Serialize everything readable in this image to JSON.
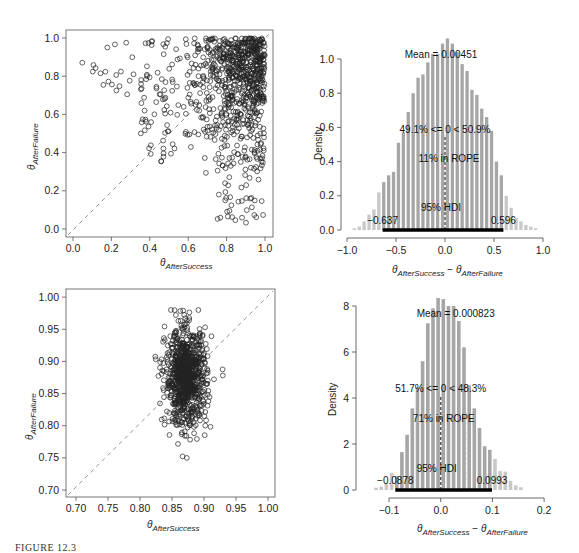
{
  "caption": "FIGURE 12.3",
  "chart_data": [
    {
      "type": "scatter",
      "panel": "top-left",
      "xlabel": "θ AfterSuccess",
      "ylabel": "θ AfterFailure",
      "xlim": [
        -0.03,
        1.03
      ],
      "ylim": [
        -0.03,
        1.03
      ],
      "xticks": [
        "0.0",
        "0.2",
        "0.4",
        "0.6",
        "0.8",
        "1.0"
      ],
      "yticks": [
        "0.0",
        "0.2",
        "0.4",
        "0.6",
        "0.8",
        "1.0"
      ],
      "reference_line": "y = x (dashed)",
      "description": "~1000 posterior samples, concentrated at high AfterSuccess (0.6–1.0) and high AfterFailure (0.4–1.0), sparse tail toward low values"
    },
    {
      "type": "bar",
      "panel": "top-right",
      "xlabel": "θ AfterSuccess − θ AfterFailure",
      "ylabel": "Density",
      "xlim": [
        -1.0,
        1.0
      ],
      "ylim": [
        0,
        1.1
      ],
      "xticks": [
        "−1.0",
        "−0.5",
        "0.0",
        "0.5",
        "1.0"
      ],
      "yticks": [
        "0.0",
        "0.2",
        "0.4",
        "0.6",
        "0.8",
        "1.0"
      ],
      "bin_width": 0.05,
      "bin_centers": [
        -0.925,
        -0.875,
        -0.825,
        -0.775,
        -0.725,
        -0.675,
        -0.625,
        -0.575,
        -0.525,
        -0.475,
        -0.425,
        -0.375,
        -0.325,
        -0.275,
        -0.225,
        -0.175,
        -0.125,
        -0.075,
        -0.025,
        0.025,
        0.075,
        0.125,
        0.175,
        0.225,
        0.275,
        0.325,
        0.375,
        0.425,
        0.475,
        0.525,
        0.575,
        0.625,
        0.675,
        0.725,
        0.775,
        0.825,
        0.875,
        0.925
      ],
      "values": [
        0.01,
        0.02,
        0.05,
        0.09,
        0.12,
        0.22,
        0.28,
        0.32,
        0.34,
        0.51,
        0.57,
        0.69,
        0.8,
        0.89,
        0.91,
        0.98,
        1.03,
        1.03,
        1.09,
        1.12,
        1.09,
        1.04,
        0.97,
        0.93,
        0.82,
        0.79,
        0.71,
        0.66,
        0.58,
        0.4,
        0.32,
        0.2,
        0.13,
        0.07,
        0.05,
        0.03,
        0.02,
        0.01
      ],
      "annotations": {
        "mean": "Mean = 0.00451",
        "compare": "49.1% <= 0 < 50.9%",
        "rope": "11% in ROPE",
        "hdi": "95% HDI",
        "hdi_low": "−0.637",
        "hdi_high": "0.596"
      },
      "hdi": [
        -0.637,
        0.596
      ],
      "rope": [
        -0.05,
        0.05
      ]
    },
    {
      "type": "scatter",
      "panel": "bottom-left",
      "xlabel": "θ AfterSuccess",
      "ylabel": "θ AfterFailure",
      "xlim": [
        0.69,
        1.01
      ],
      "ylim": [
        0.69,
        1.01
      ],
      "xticks": [
        "0.70",
        "0.75",
        "0.80",
        "0.85",
        "0.90",
        "0.95",
        "1.00"
      ],
      "yticks": [
        "0.70",
        "0.75",
        "0.80",
        "0.85",
        "0.90",
        "0.95",
        "1.00"
      ],
      "reference_line": "y = x (dashed)",
      "description": "~1000 posterior samples clustered around (0.87, 0.88), x spread 0.82–0.93, y spread 0.72–0.98"
    },
    {
      "type": "bar",
      "panel": "bottom-right",
      "xlabel": "θ AfterSuccess − θ AfterFailure",
      "ylabel": "Density",
      "xlim": [
        -0.15,
        0.2
      ],
      "ylim": [
        0,
        8.5
      ],
      "xticks": [
        "−0.1",
        "0.0",
        "0.1",
        "0.2"
      ],
      "yticks": [
        "0",
        "2",
        "4",
        "6",
        "8"
      ],
      "bin_width": 0.01,
      "bin_centers": [
        -0.125,
        -0.115,
        -0.105,
        -0.095,
        -0.085,
        -0.075,
        -0.065,
        -0.055,
        -0.045,
        -0.035,
        -0.025,
        -0.015,
        -0.005,
        0.005,
        0.015,
        0.025,
        0.035,
        0.045,
        0.055,
        0.065,
        0.075,
        0.085,
        0.095,
        0.105,
        0.115,
        0.125,
        0.135,
        0.145,
        0.155
      ],
      "values": [
        0.1,
        0.15,
        0.3,
        0.75,
        0.6,
        1.65,
        2.4,
        3.55,
        4.45,
        5.6,
        7.25,
        7.9,
        8.35,
        8.3,
        8.0,
        8.0,
        7.35,
        6.2,
        4.55,
        3.55,
        2.7,
        1.9,
        1.75,
        1.35,
        0.82,
        0.8,
        0.4,
        0.2,
        0.12
      ],
      "annotations": {
        "mean": "Mean = 0.000823",
        "compare": "51.7% <= 0 < 48.3%",
        "rope": "71% in ROPE",
        "hdi": "95% HDI",
        "hdi_low": "−0.0878",
        "hdi_high": "0.0993"
      },
      "hdi": [
        -0.0878,
        0.0993
      ],
      "rope": [
        -0.05,
        0.05
      ]
    }
  ],
  "panels": {
    "tl": {
      "xlabel_main": "θ",
      "xlabel_sub": "AfterSuccess",
      "ylabel_main": "θ",
      "ylabel_sub": "AfterFailure"
    },
    "tr": {
      "ylabel": "Density",
      "xlabel_a": "θ",
      "xlabel_a_sub": "AfterSuccess",
      "xlabel_minus": " − ",
      "xlabel_b": "θ",
      "xlabel_b_sub": "AfterFailure"
    },
    "bl": {
      "xlabel_main": "θ",
      "xlabel_sub": "AfterSuccess",
      "ylabel_main": "θ",
      "ylabel_sub": "AfterFailure"
    },
    "br": {
      "ylabel": "Density",
      "xlabel_a": "θ",
      "xlabel_a_sub": "AfterSuccess",
      "xlabel_minus": " − ",
      "xlabel_b": "θ",
      "xlabel_b_sub": "AfterFailure"
    }
  }
}
